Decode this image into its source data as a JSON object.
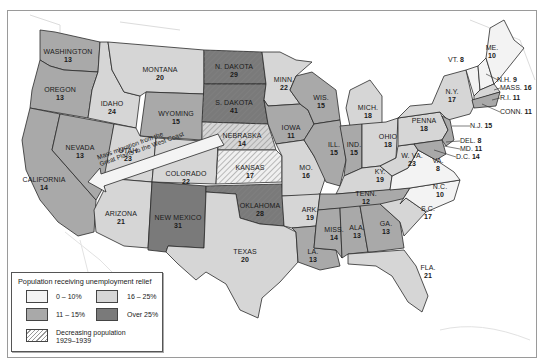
{
  "map": {
    "subject": "Population receiving unemployment relief by state",
    "colors": {
      "range_0_10": "#f3f3f3",
      "range_11_15": "#a9a9a9",
      "range_16_25": "#d6d6d6",
      "range_over_25": "#7a7a7a",
      "hatch": "#8a8a8a",
      "water": "#ffffff",
      "border": "#2a2a2a"
    },
    "states": [
      {
        "name": "WASHINGTON",
        "value": "13",
        "category": "11-15%"
      },
      {
        "name": "OREGON",
        "value": "13",
        "category": "11-15%"
      },
      {
        "name": "CALIFORNIA",
        "value": "14",
        "category": "11-15%"
      },
      {
        "name": "NEVADA",
        "value": "13",
        "category": "11-15%"
      },
      {
        "name": "IDAHO",
        "value": "24",
        "category": "16-25%"
      },
      {
        "name": "MONTANA",
        "value": "20",
        "category": "16-25%"
      },
      {
        "name": "WYOMING",
        "value": "15",
        "category": "11-15%"
      },
      {
        "name": "UTAH",
        "value": "23",
        "category": "16-25%"
      },
      {
        "name": "COLORADO",
        "value": "22",
        "category": "16-25%"
      },
      {
        "name": "ARIZONA",
        "value": "21",
        "category": "16-25%"
      },
      {
        "name": "NEW MEXICO",
        "value": "31",
        "category": "Over 25%"
      },
      {
        "name": "N. DAKOTA",
        "value": "29",
        "category": "Over 25%",
        "decreasing": true
      },
      {
        "name": "S. DAKOTA",
        "value": "41",
        "category": "Over 25%",
        "decreasing": true
      },
      {
        "name": "NEBRASKA",
        "value": "14",
        "category": "11-15%",
        "decreasing": true
      },
      {
        "name": "KANSAS",
        "value": "17",
        "category": "16-25%",
        "decreasing": true
      },
      {
        "name": "OKLAHOMA",
        "value": "28",
        "category": "Over 25%",
        "decreasing": true
      },
      {
        "name": "TEXAS",
        "value": "20",
        "category": "16-25%"
      },
      {
        "name": "MINN.",
        "value": "22",
        "category": "16-25%"
      },
      {
        "name": "IOWA",
        "value": "11",
        "category": "11-15%"
      },
      {
        "name": "MO.",
        "value": "16",
        "category": "16-25%"
      },
      {
        "name": "ARK.",
        "value": "19",
        "category": "16-25%"
      },
      {
        "name": "LA.",
        "value": "13",
        "category": "11-15%"
      },
      {
        "name": "WIS.",
        "value": "15",
        "category": "11-15%"
      },
      {
        "name": "ILL.",
        "value": "15",
        "category": "11-15%"
      },
      {
        "name": "MICH.",
        "value": "18",
        "category": "16-25%"
      },
      {
        "name": "IND.",
        "value": "15",
        "category": "11-15%"
      },
      {
        "name": "OHIO",
        "value": "18",
        "category": "16-25%"
      },
      {
        "name": "KY.",
        "value": "19",
        "category": "16-25%"
      },
      {
        "name": "TENN.",
        "value": "12",
        "category": "11-15%"
      },
      {
        "name": "MISS.",
        "value": "14",
        "category": "11-15%"
      },
      {
        "name": "ALA.",
        "value": "13",
        "category": "11-15%"
      },
      {
        "name": "GA.",
        "value": "13",
        "category": "11-15%"
      },
      {
        "name": "FLA.",
        "value": "21",
        "category": "16-25%"
      },
      {
        "name": "S.C.",
        "value": "17",
        "category": "16-25%"
      },
      {
        "name": "N.C.",
        "value": "10",
        "category": "0-10%"
      },
      {
        "name": "VA.",
        "value": "8",
        "category": "0-10%"
      },
      {
        "name": "W. VA.",
        "value": "23",
        "category": "16-25%"
      },
      {
        "name": "PENNA",
        "value": "18",
        "category": "16-25%"
      },
      {
        "name": "N.Y.",
        "value": "17",
        "category": "16-25%"
      },
      {
        "name": "ME.",
        "value": "10",
        "category": "0-10%"
      }
    ],
    "callouts": [
      {
        "name": "VT.",
        "value": "8"
      },
      {
        "name": "N.H.",
        "value": "9"
      },
      {
        "name": "MASS.",
        "value": "16"
      },
      {
        "name": "R.I.",
        "value": "11"
      },
      {
        "name": "CONN.",
        "value": "11"
      },
      {
        "name": "N.J.",
        "value": "15"
      },
      {
        "name": "DEL.",
        "value": "8"
      },
      {
        "name": "MD.",
        "value": "11"
      },
      {
        "name": "D.C.",
        "value": "14"
      }
    ],
    "arrow": {
      "line1": "Mass migration from the",
      "line2": "Great Plains to the West Coast"
    }
  },
  "legend": {
    "title": "Population receiving unemployment relief",
    "items": [
      {
        "label": "0 – 10%",
        "color": "#f3f3f3"
      },
      {
        "label": "16 – 25%",
        "color": "#d6d6d6"
      },
      {
        "label": "11 – 15%",
        "color": "#a9a9a9"
      },
      {
        "label": "Over 25%",
        "color": "#7a7a7a"
      }
    ],
    "hatch_label_line1": "Decreasing population",
    "hatch_label_line2": "1929–1939"
  }
}
